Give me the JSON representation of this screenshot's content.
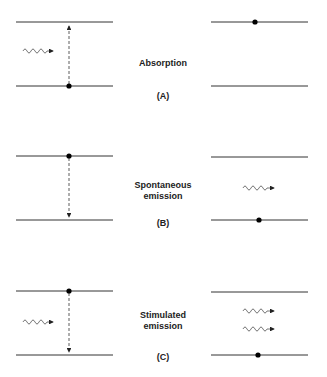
{
  "panels": [
    {
      "id": "A",
      "title": "Absorption",
      "tag": "(A)"
    },
    {
      "id": "B",
      "title_line1": "Spontaneous",
      "title_line2": "emission",
      "tag": "(B)"
    },
    {
      "id": "C",
      "title_line1": "Stimulated",
      "title_line2": "emission",
      "tag": "(C)"
    }
  ],
  "colors": {
    "line": "#333333",
    "dot": "#000000",
    "wave": "#555555"
  }
}
